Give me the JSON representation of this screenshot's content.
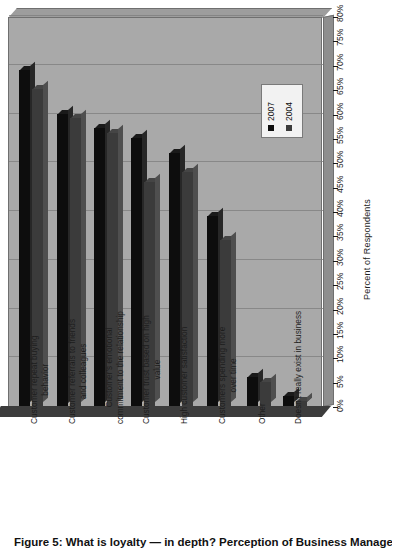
{
  "chart_data": {
    "type": "bar",
    "title": "What is loyalty — in depth? Perception of Business Managers",
    "xlabel": "",
    "ylabel": "Percent of Respondents",
    "ylim": [
      0,
      80
    ],
    "ytick_step": 5,
    "grid": true,
    "orientation": "rotated-90-vertical-bars",
    "legend_position": "upper-right-inside",
    "categories": [
      "Customer repeat buying behavior",
      "Customer referrals to friends and colleagues",
      "Customer's emotional commitment to the relationship",
      "Customer trust based on high value",
      "High customer satisfaction",
      "Customers spending more over time",
      "Other",
      "Doesn't really exist in business"
    ],
    "category_lines": [
      [
        "Customer repeat buying",
        "behavior"
      ],
      [
        "Customer referrals to friends",
        "and colleagues"
      ],
      [
        "Customer's emotional",
        "commitment to the relationship"
      ],
      [
        "Customer trust based on high",
        "value"
      ],
      [
        "High customer satisfaction"
      ],
      [
        "Customers spending more",
        "over time"
      ],
      [
        "Other"
      ],
      [
        "Doesn't really exist in business"
      ]
    ],
    "series": [
      {
        "name": "2007",
        "color": "#0d0d0d",
        "values": [
          69,
          60,
          57,
          55,
          52,
          39,
          6,
          2
        ]
      },
      {
        "name": "2004",
        "color": "#3b3b3b",
        "values": [
          65,
          59,
          56,
          46,
          48,
          34,
          5,
          1
        ]
      }
    ],
    "ticks": [
      "0%",
      "5%",
      "10%",
      "15%",
      "20%",
      "25%",
      "30%",
      "35%",
      "40%",
      "45%",
      "50%",
      "55%",
      "60%",
      "65%",
      "70%",
      "75%",
      "80%"
    ],
    "gridline_values": [
      10,
      20,
      30,
      40,
      50,
      60,
      70,
      80
    ]
  },
  "legend": {
    "items": [
      {
        "label": "2007",
        "color": "#0d0d0d"
      },
      {
        "label": "2004",
        "color": "#3b3b3b"
      }
    ]
  },
  "axis": {
    "value_axis_title": "Percent of Respondents"
  },
  "caption": {
    "text": "Figure 5: What is loyalty — in depth? Perception of Business Managers"
  }
}
